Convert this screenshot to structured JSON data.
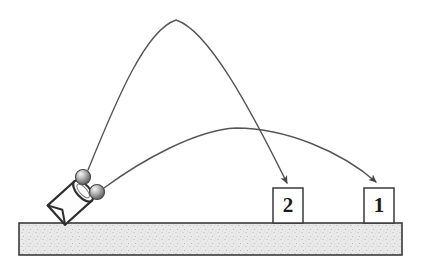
{
  "diagram": {
    "background_color": "#ffffff",
    "line_color": "#555555",
    "outline_color": "#333333",
    "ground": {
      "name": "ground-bar",
      "fill_color": "#e8e8e8",
      "border_color": "#3a3a3a",
      "x": 19,
      "y": 223,
      "width": 383,
      "height": 32,
      "texture": "stipple"
    },
    "launcher": {
      "name": "launcher-cup",
      "label": "",
      "outline_color": "#2e2e2e",
      "fill_color": "#fdfdfd",
      "tilt_degrees": -45,
      "center_x": 72,
      "center_y": 200
    },
    "projectiles": [
      {
        "name": "ball-upper",
        "cx": 83,
        "cy": 177,
        "r": 7.5,
        "fill_color": "#9a9a9a",
        "highlight_color": "#f2f2f2"
      },
      {
        "name": "ball-lower",
        "cx": 97,
        "cy": 192,
        "r": 7.5,
        "fill_color": "#9a9a9a",
        "highlight_color": "#f2f2f2"
      }
    ],
    "trajectories": [
      {
        "name": "trajectory-high-arc",
        "target_box": "2",
        "apex_x": 176,
        "apex_y": 20,
        "start_x": 88,
        "start_y": 170,
        "end_x": 288,
        "end_y": 186,
        "stroke_color": "#555555",
        "stroke_width": 1.4,
        "arrowhead": true
      },
      {
        "name": "trajectory-low-arc",
        "target_box": "1",
        "apex_x": 236,
        "apex_y": 128,
        "start_x": 103,
        "start_y": 187,
        "end_x": 377,
        "end_y": 186,
        "stroke_color": "#555555",
        "stroke_width": 1.4,
        "arrowhead": true
      }
    ],
    "boxes": [
      {
        "name": "target-box-2",
        "label": "2",
        "x": 273,
        "y": 188,
        "width": 30,
        "height": 35,
        "fill_color": "#ffffff",
        "border_color": "#3a3a3a"
      },
      {
        "name": "target-box-1",
        "label": "1",
        "x": 364,
        "y": 188,
        "width": 30,
        "height": 35,
        "fill_color": "#ffffff",
        "border_color": "#3a3a3a"
      }
    ]
  }
}
